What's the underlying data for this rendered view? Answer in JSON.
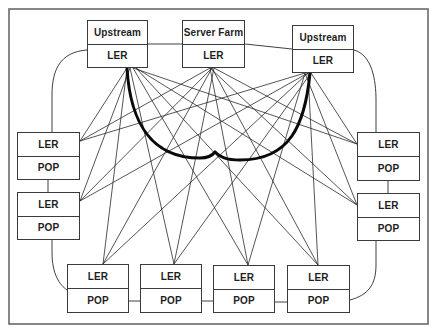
{
  "diagram": {
    "frame": {
      "x": 9,
      "y": 9,
      "w": 419,
      "h": 315,
      "color": "#6a6a6a"
    },
    "colors": {
      "line": "#2a2a2a",
      "thick": "#0a0a0a",
      "box_border": "#3a3a3a",
      "text": "#1e1e1e"
    },
    "nodes": [
      {
        "id": "upstream-left",
        "x": 87,
        "y": 20,
        "w": 61,
        "h": 48,
        "top": "Upstream",
        "bottom": "LER"
      },
      {
        "id": "server-farm",
        "x": 182,
        "y": 20,
        "w": 63,
        "h": 48,
        "top": "Server Farm",
        "bottom": "LER"
      },
      {
        "id": "upstream-right",
        "x": 292,
        "y": 25,
        "w": 62,
        "h": 48,
        "top": "Upstream",
        "bottom": "LER"
      },
      {
        "id": "pop-left-1",
        "x": 17,
        "y": 132,
        "w": 63,
        "h": 48,
        "top": "LER",
        "bottom": "POP"
      },
      {
        "id": "pop-left-2",
        "x": 17,
        "y": 192,
        "w": 63,
        "h": 48,
        "top": "LER",
        "bottom": "POP"
      },
      {
        "id": "pop-right-1",
        "x": 357,
        "y": 132,
        "w": 63,
        "h": 49,
        "top": "LER",
        "bottom": "POP"
      },
      {
        "id": "pop-right-2",
        "x": 357,
        "y": 193,
        "w": 63,
        "h": 48,
        "top": "LER",
        "bottom": "POP"
      },
      {
        "id": "pop-bottom-1",
        "x": 67,
        "y": 264,
        "w": 62,
        "h": 49,
        "top": "LER",
        "bottom": "POP"
      },
      {
        "id": "pop-bottom-2",
        "x": 140,
        "y": 264,
        "w": 62,
        "h": 49,
        "top": "LER",
        "bottom": "POP"
      },
      {
        "id": "pop-bottom-3",
        "x": 213,
        "y": 265,
        "w": 62,
        "h": 48,
        "top": "LER",
        "bottom": "POP"
      },
      {
        "id": "pop-bottom-4",
        "x": 287,
        "y": 265,
        "w": 63,
        "h": 48,
        "top": "LER",
        "bottom": "POP"
      }
    ],
    "ring_paths": [
      "M87,50 C60,52 52,70 52,95 L52,132",
      "M148,44 L182,44",
      "M245,44 L292,49",
      "M354,50 C372,55 376,80 376,100 L376,132",
      "M48,180 L48,192",
      "M388,181 L388,193",
      "M52,240 L52,252 C52,275 60,285 67,290",
      "M129,301 L140,301",
      "M202,301 L213,301",
      "M275,302 L287,302",
      "M350,300 C368,295 376,285 376,265 L376,241"
    ],
    "thick_paths": [
      "M127,68 C130,120 150,158 200,158 C208,158 212,156 215,152",
      "M310,73 C305,125 290,160 240,160 C226,160 220,157 215,152"
    ],
    "mesh_sources": {
      "upstream-left": [
        [
          127,
          68
        ],
        [
          130,
          68
        ],
        [
          133,
          68
        ],
        [
          136,
          68
        ]
      ],
      "server-farm": [
        [
          210,
          68
        ],
        [
          212,
          68
        ],
        [
          214,
          68
        ]
      ],
      "upstream-right": [
        [
          305,
          73
        ],
        [
          308,
          73
        ],
        [
          311,
          73
        ]
      ]
    },
    "mesh_targets": {
      "pop-left-1": [
        80,
        141
      ],
      "pop-left-2": [
        80,
        201
      ],
      "pop-right-1": [
        357,
        144
      ],
      "pop-right-2": [
        357,
        205
      ],
      "pop-bottom-1": [
        103,
        264
      ],
      "pop-bottom-2": [
        174,
        264
      ],
      "pop-bottom-3": [
        248,
        265
      ],
      "pop-bottom-4": [
        318,
        265
      ]
    },
    "mesh_edges": [
      [
        "upstream-left",
        "pop-left-1"
      ],
      [
        "upstream-left",
        "pop-left-2"
      ],
      [
        "upstream-left",
        "pop-right-1"
      ],
      [
        "upstream-left",
        "pop-right-2"
      ],
      [
        "upstream-left",
        "pop-bottom-1"
      ],
      [
        "upstream-left",
        "pop-bottom-2"
      ],
      [
        "upstream-left",
        "pop-bottom-3"
      ],
      [
        "upstream-left",
        "pop-bottom-4"
      ],
      [
        "server-farm",
        "pop-left-1"
      ],
      [
        "server-farm",
        "pop-left-2"
      ],
      [
        "server-farm",
        "pop-right-1"
      ],
      [
        "server-farm",
        "pop-right-2"
      ],
      [
        "server-farm",
        "pop-bottom-1"
      ],
      [
        "server-farm",
        "pop-bottom-2"
      ],
      [
        "server-farm",
        "pop-bottom-3"
      ],
      [
        "server-farm",
        "pop-bottom-4"
      ],
      [
        "upstream-right",
        "pop-left-1"
      ],
      [
        "upstream-right",
        "pop-left-2"
      ],
      [
        "upstream-right",
        "pop-right-1"
      ],
      [
        "upstream-right",
        "pop-right-2"
      ],
      [
        "upstream-right",
        "pop-bottom-1"
      ],
      [
        "upstream-right",
        "pop-bottom-2"
      ],
      [
        "upstream-right",
        "pop-bottom-3"
      ],
      [
        "upstream-right",
        "pop-bottom-4"
      ]
    ]
  }
}
